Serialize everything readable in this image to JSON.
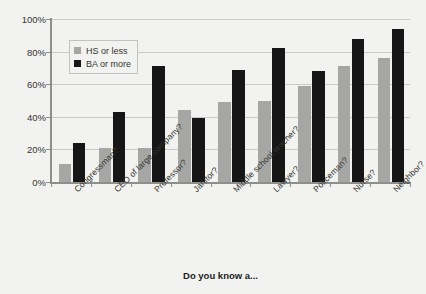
{
  "chart_data": {
    "type": "bar",
    "title": "",
    "subtitle": "",
    "xlabel": "Do you know a...",
    "ylabel": "",
    "ylim": [
      0,
      100
    ],
    "ytick_labels": [
      "100%",
      "80%",
      "60%",
      "40%",
      "20%",
      "0%"
    ],
    "ytick_values": [
      100,
      80,
      60,
      40,
      20,
      0
    ],
    "grid": "horizontal",
    "legend_position": "upper-left-inside",
    "categories": [
      "Congressman?",
      "CEO of large company?",
      "Professor?",
      "Janitor?",
      "Middle school teacher?",
      "Lawyer?",
      "Policeman?",
      "Nurse?",
      "Neighbor?"
    ],
    "series": [
      {
        "name": "HS or less",
        "color": "#a6a6a4",
        "values": [
          11,
          21,
          21,
          44,
          49,
          50,
          59,
          71,
          76
        ]
      },
      {
        "name": "BA or more",
        "color": "#161616",
        "values": [
          24,
          43,
          71,
          39,
          69,
          82,
          68,
          88,
          94
        ]
      }
    ]
  },
  "legend": {
    "items": [
      {
        "label": "HS or less",
        "color": "#a6a6a4"
      },
      {
        "label": "BA or more",
        "color": "#161616"
      }
    ]
  },
  "axis": {
    "x_title": "Do you know a..."
  },
  "colors": {
    "background": "#f2f2f0",
    "grid": "#c9c9c7",
    "axis": "#8e8e8c",
    "text": "#35352f",
    "series_hs": "#a6a6a4",
    "series_ba": "#161616"
  }
}
